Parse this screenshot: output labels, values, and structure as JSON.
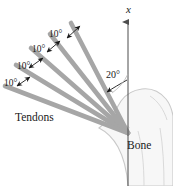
{
  "figure": {
    "background_color": "#ffffff",
    "width": 173,
    "height": 186
  },
  "colors": {
    "tendon": "#a6a6a6",
    "tendon_dark": "#8f8f8f",
    "bone_outline": "#c9c9c9",
    "bone_fill": "#f7f7f7",
    "axis": "#4d4d4d",
    "text": "#1a1a1a",
    "arrow": "#1a1a1a"
  },
  "axis": {
    "name": "x-axis",
    "label": "x",
    "orientation": "vertical-up",
    "arrowhead": "up"
  },
  "labels": {
    "tendons": "Tendons",
    "bone": "Bone",
    "axis_x": "x"
  },
  "angles": [
    {
      "id": "angle-20",
      "value": "20°",
      "between": "x-axis and first tendon"
    },
    {
      "id": "angle-10-a",
      "value": "10°",
      "between": "tendon 1 and tendon 2"
    },
    {
      "id": "angle-10-b",
      "value": "10°",
      "between": "tendon 2 and tendon 3"
    },
    {
      "id": "angle-10-c",
      "value": "10°",
      "between": "tendon 3 and tendon 4"
    },
    {
      "id": "angle-10-d",
      "value": "10°",
      "between": "tendon 4 and tendon 5"
    }
  ],
  "tendons": {
    "count": 5,
    "origin": {
      "x": 128,
      "y": 133
    },
    "angles_from_axis_deg": [
      20,
      30,
      40,
      50,
      60
    ]
  },
  "icons": {
    "axis_arrow": "arrow-up-icon",
    "angle_marker": "double-headed-arrow-icon",
    "leader": "curved-arrow-icon"
  }
}
